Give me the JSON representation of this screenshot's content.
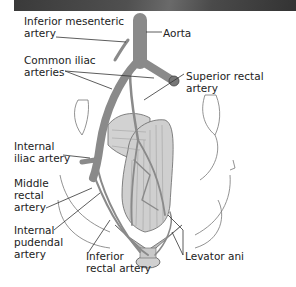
{
  "figure": {
    "type": "anatomical-diagram",
    "colors": {
      "artery": "#8a8a8a",
      "muscle": "#c8c8c8",
      "outline": "#555555",
      "text": "#222222",
      "banner": "#4a4a4a"
    }
  },
  "labels": {
    "inferior_mesenteric": "Inferior mesenteric\nartery",
    "aorta": "Aorta",
    "common_iliac": "Common iliac\narteries",
    "superior_rectal": "Superior rectal artery",
    "internal_iliac": "Internal\niliac artery",
    "middle_rectal": "Middle\nrectal\nartery",
    "internal_pudendal": "Internal\npudendal\nartery",
    "inferior_rectal": "Inferior\nrectal artery",
    "levator_ani": "Levator ani"
  }
}
